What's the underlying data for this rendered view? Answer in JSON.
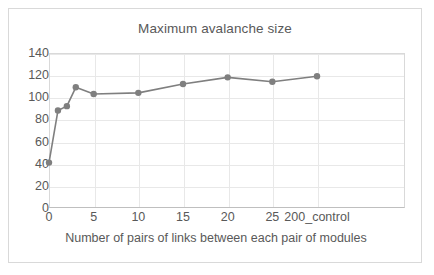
{
  "chart_data": {
    "type": "line",
    "title": "Maximum avalanche size",
    "xlabel": "Number of pairs of links between each pair of modules",
    "ylabel": "",
    "categories": [
      "0",
      "1",
      "2",
      "3",
      "5",
      "10",
      "15",
      "20",
      "25",
      "200_control"
    ],
    "x_tick_labels": [
      "0",
      "5",
      "10",
      "15",
      "20",
      "25",
      "200_control"
    ],
    "values": [
      41,
      88,
      92,
      109,
      103,
      104,
      112,
      118,
      114,
      119
    ],
    "ylim": [
      0,
      140
    ],
    "y_ticks": [
      0,
      20,
      40,
      60,
      80,
      100,
      120,
      140
    ],
    "grid": "horizontal-and-vertical",
    "legend": "none",
    "series_color": "#7f7f7f",
    "marker": "circle",
    "series": [
      {
        "name": "Maximum avalanche size",
        "points": [
          {
            "x": "0",
            "y": 41
          },
          {
            "x": "1",
            "y": 88
          },
          {
            "x": "2",
            "y": 92
          },
          {
            "x": "3",
            "y": 109
          },
          {
            "x": "5",
            "y": 103
          },
          {
            "x": "10",
            "y": 104
          },
          {
            "x": "15",
            "y": 112
          },
          {
            "x": "20",
            "y": 118
          },
          {
            "x": "25",
            "y": 114
          },
          {
            "x": "200_control",
            "y": 119
          }
        ]
      }
    ]
  },
  "colors": {
    "series": "#7f7f7f",
    "gridline": "#e8e8e8",
    "axis": "#bfbfbf",
    "text": "#595959",
    "frame": "#d9d9d9",
    "background": "#ffffff"
  }
}
